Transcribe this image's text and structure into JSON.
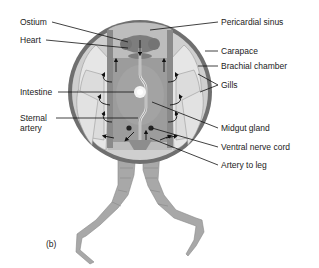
{
  "figure": {
    "panel_label": "(b)",
    "colors": {
      "carapace": "#6f6f6f",
      "branchial_fill": "#cfcfcf",
      "gill": "#e2e2e2",
      "gill_stroke": "#9a9a9a",
      "body_fill": "#a9a9a9",
      "sinus_fill": "#bdbdbd",
      "heart": "#7d7d7d",
      "midgut": "#9c9c9c",
      "leg": "#a8a8a8",
      "arrow": "#111111",
      "leader": "#111111"
    },
    "labels_left": {
      "ostium": "Ostium",
      "heart": "Heart",
      "intestine": "Intestine",
      "sternal_artery_1": "Sternal",
      "sternal_artery_2": "artery"
    },
    "labels_right": {
      "pericardial_sinus": "Pericardial sinus",
      "carapace": "Carapace",
      "brachial_chamber": "Brachial chamber",
      "gills": "Gills",
      "midgut_gland": "Midgut gland",
      "ventral_nerve_cord": "Ventral nerve cord",
      "artery_to_leg": "Artery to leg"
    }
  }
}
